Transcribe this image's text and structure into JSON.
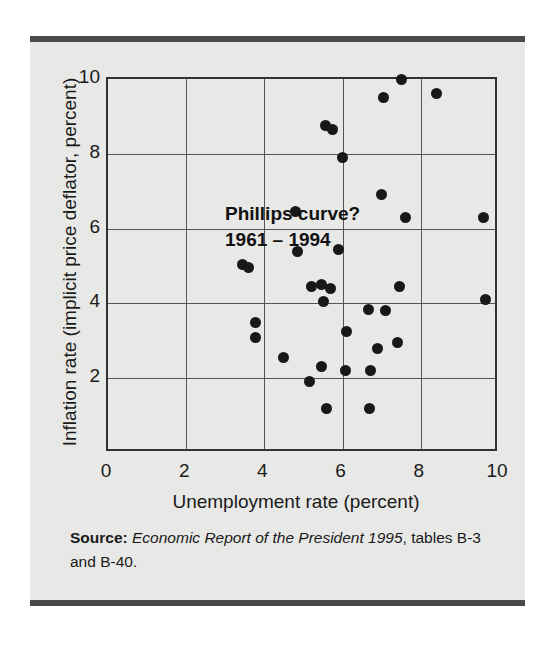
{
  "figure": {
    "background_color": "#e8e8e6",
    "rule_color": "#4a4a4a",
    "point_color": "#181818",
    "axis_color": "#333333",
    "grid_color": "#555555"
  },
  "annotation": {
    "line1": "Phillips curve?",
    "line2": "1961 – 1994"
  },
  "source": {
    "label": "Source:",
    "title": "Economic Report of the President 1995",
    "rest": ", tables B-3 and B-40."
  },
  "chart_data": {
    "type": "scatter",
    "title": "Phillips curve? 1961 – 1994",
    "xlabel": "Unemployment rate (percent)",
    "ylabel": "Inflation rate (implicit price deflator, percent)",
    "xlim": [
      0,
      10
    ],
    "ylim": [
      0,
      10
    ],
    "xticks": [
      0,
      2,
      4,
      6,
      8,
      10
    ],
    "yticks": [
      2,
      4,
      6,
      8,
      10
    ],
    "grid": true,
    "legend": null,
    "series": [
      {
        "name": "Annual unemployment vs inflation, 1961–1994",
        "points": [
          [
            3.45,
            5.05
          ],
          [
            3.6,
            4.95
          ],
          [
            3.78,
            3.5
          ],
          [
            3.78,
            3.1
          ],
          [
            4.48,
            2.55
          ],
          [
            4.8,
            6.45
          ],
          [
            4.85,
            5.4
          ],
          [
            5.15,
            1.9
          ],
          [
            5.2,
            4.45
          ],
          [
            5.45,
            4.5
          ],
          [
            5.5,
            4.05
          ],
          [
            5.55,
            8.75
          ],
          [
            5.6,
            1.2
          ],
          [
            5.7,
            4.4
          ],
          [
            5.75,
            8.65
          ],
          [
            5.45,
            2.3
          ],
          [
            5.9,
            5.45
          ],
          [
            6.0,
            7.9
          ],
          [
            6.07,
            2.2
          ],
          [
            6.1,
            3.25
          ],
          [
            6.65,
            3.85
          ],
          [
            6.7,
            1.2
          ],
          [
            6.72,
            2.2
          ],
          [
            6.9,
            2.8
          ],
          [
            7.0,
            6.9
          ],
          [
            7.05,
            9.5
          ],
          [
            7.1,
            3.8
          ],
          [
            7.4,
            2.95
          ],
          [
            7.45,
            4.45
          ],
          [
            7.5,
            10.0
          ],
          [
            7.6,
            6.3
          ],
          [
            8.4,
            9.6
          ],
          [
            9.6,
            6.3
          ],
          [
            9.65,
            4.1
          ]
        ]
      }
    ]
  }
}
